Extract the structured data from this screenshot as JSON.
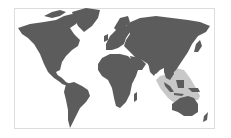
{
  "map": {
    "title": "World map",
    "highlighted_region": "Southeast Asia / Maritime Southeast Asia to northern Australia",
    "colors": {
      "land": "#5c5c5c",
      "highlight": "#c8c8c8",
      "background": "#ffffff",
      "border": "#dcdcdc"
    }
  }
}
